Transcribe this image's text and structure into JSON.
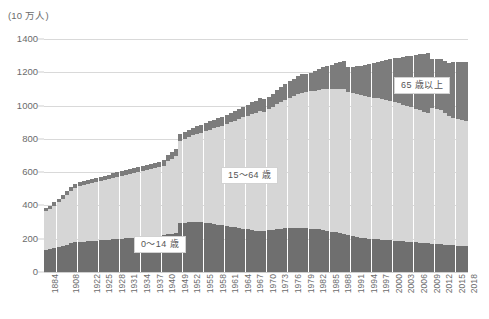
{
  "chart_data": {
    "type": "bar",
    "stacked": true,
    "title": "",
    "subtitle": "",
    "xlabel": "",
    "ylabel": "(10 万人)",
    "yunit_label": "(10 万人)",
    "ylim": [
      0,
      1400
    ],
    "yticks": [
      0,
      200,
      400,
      600,
      800,
      1000,
      1200,
      1400
    ],
    "ytick_labels": [
      "0",
      "200",
      "400",
      "600",
      "800",
      "1000",
      "1200",
      "1400"
    ],
    "grid": true,
    "grid_axis": "y",
    "legend": "in-plot annotations",
    "annotations": [
      {
        "text": "0〜14 歳",
        "series": "0-14"
      },
      {
        "text": "15〜64 歳",
        "series": "15-64"
      },
      {
        "text": "65 歳以上",
        "series": "65+"
      }
    ],
    "colors": {
      "0-14": "#6f6f6f",
      "15-64": "#d6d6d6",
      "65+": "#7c7c7c",
      "gridline": "#d9d9d9",
      "text": "#6b6b6b",
      "background": "#ffffff"
    },
    "categories": [
      "1884",
      "1888",
      "1893",
      "1898",
      "1903",
      "1908",
      "1913",
      "1918",
      "1920",
      "1921",
      "1922",
      "1923",
      "1924",
      "1925",
      "1926",
      "1927",
      "1928",
      "1929",
      "1930",
      "1931",
      "1932",
      "1933",
      "1934",
      "1935",
      "1936",
      "1937",
      "1938",
      "1939",
      "1940",
      "1947",
      "1948",
      "1949",
      "1950",
      "1951",
      "1952",
      "1953",
      "1954",
      "1955",
      "1956",
      "1957",
      "1958",
      "1959",
      "1960",
      "1961",
      "1962",
      "1963",
      "1964",
      "1965",
      "1966",
      "1967",
      "1968",
      "1969",
      "1970",
      "1971",
      "1972",
      "1973",
      "1974",
      "1975",
      "1976",
      "1977",
      "1978",
      "1979",
      "1980",
      "1981",
      "1982",
      "1983",
      "1984",
      "1985",
      "1986",
      "1987",
      "1988",
      "1989",
      "1990",
      "1991",
      "1992",
      "1993",
      "1994",
      "1995",
      "1996",
      "1997",
      "1998",
      "1999",
      "2000",
      "2001",
      "2002",
      "2003",
      "2004",
      "2005",
      "2006",
      "2007",
      "2008",
      "2009",
      "2010",
      "2011",
      "2012",
      "2013",
      "2014",
      "2015",
      "2016",
      "2017",
      "2018"
    ],
    "xtick_labels_shown": [
      "1884",
      "1908",
      "1922",
      "1925",
      "1928",
      "1931",
      "1934",
      "1937",
      "1940",
      "1949",
      "1952",
      "1955",
      "1958",
      "1961",
      "1964",
      "1967",
      "1970",
      "1973",
      "1976",
      "1979",
      "1982",
      "1985",
      "1988",
      "1991",
      "1994",
      "1997",
      "2000",
      "2003",
      "2006",
      "2009",
      "2012",
      "2015",
      "2018"
    ],
    "series": [
      {
        "name": "0〜14 歳",
        "key": "0-14",
        "color": "#6f6f6f",
        "values": [
          135,
          140,
          146,
          152,
          158,
          165,
          172,
          178,
          181,
          183,
          185,
          187,
          189,
          191,
          193,
          195,
          197,
          199,
          201,
          203,
          205,
          207,
          209,
          211,
          213,
          215,
          217,
          219,
          221,
          226,
          230,
          234,
          294,
          296,
          298,
          300,
          300,
          298,
          295,
          292,
          288,
          284,
          280,
          276,
          272,
          268,
          264,
          260,
          256,
          252,
          248,
          246,
          249,
          251,
          254,
          257,
          260,
          262,
          264,
          265,
          265,
          264,
          263,
          261,
          259,
          256,
          252,
          248,
          243,
          238,
          233,
          228,
          222,
          217,
          212,
          207,
          202,
          200,
          198,
          196,
          194,
          192,
          190,
          188,
          186,
          184,
          182,
          180,
          178,
          176,
          174,
          172,
          170,
          168,
          166,
          164,
          162,
          160,
          158,
          156,
          154
        ]
      },
      {
        "name": "15〜64 歳",
        "key": "15-64",
        "color": "#d6d6d6",
        "values": [
          230,
          240,
          252,
          266,
          280,
          296,
          312,
          326,
          334,
          338,
          342,
          346,
          350,
          354,
          358,
          362,
          366,
          370,
          374,
          378,
          382,
          386,
          390,
          394,
          398,
          402,
          406,
          410,
          414,
          440,
          452,
          464,
          495,
          503,
          512,
          521,
          530,
          540,
          552,
          564,
          576,
          588,
          600,
          614,
          628,
          642,
          656,
          670,
          684,
          698,
          710,
          722,
          714,
          726,
          738,
          750,
          762,
          774,
          784,
          794,
          802,
          810,
          817,
          824,
          831,
          838,
          845,
          852,
          857,
          862,
          866,
          870,
          860,
          858,
          857,
          856,
          855,
          853,
          850,
          847,
          844,
          840,
          836,
          832,
          827,
          822,
          816,
          810,
          804,
          797,
          790,
          783,
          816,
          811,
          805,
          790,
          776,
          764,
          760,
          757,
          754
        ]
      },
      {
        "name": "65 歳以上",
        "key": "65+",
        "color": "#7c7c7c",
        "values": [
          18,
          19,
          20,
          21,
          22,
          23,
          24,
          25,
          26,
          26,
          27,
          27,
          28,
          28,
          29,
          29,
          30,
          30,
          31,
          31,
          32,
          32,
          33,
          33,
          34,
          34,
          35,
          35,
          36,
          38,
          39,
          40,
          42,
          43,
          44,
          45,
          46,
          47,
          48,
          50,
          51,
          53,
          54,
          56,
          58,
          60,
          62,
          64,
          66,
          69,
          72,
          75,
          74,
          77,
          80,
          84,
          88,
          92,
          97,
          102,
          108,
          114,
          107,
          112,
          118,
          125,
          132,
          139,
          146,
          154,
          162,
          170,
          148,
          157,
          167,
          177,
          187,
          197,
          208,
          219,
          230,
          241,
          252,
          263,
          275,
          287,
          299,
          311,
          323,
          335,
          347,
          359,
          294,
          300,
          306,
          312,
          318,
          338,
          345,
          350,
          354
        ]
      }
    ],
    "total_peak": {
      "year": "2010",
      "value": 1280
    },
    "first_total": {
      "year": "1884",
      "value": 383
    },
    "last_total": {
      "year": "2018",
      "value": 1262
    }
  }
}
